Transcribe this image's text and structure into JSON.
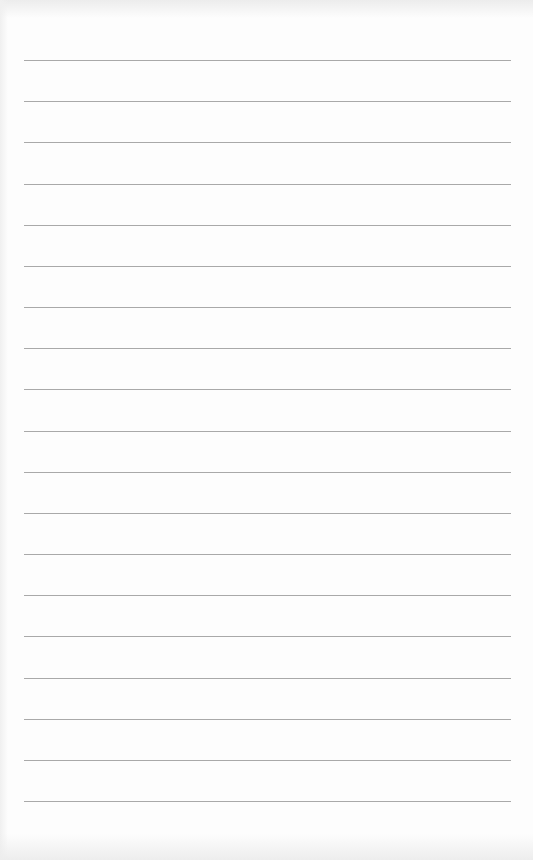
{
  "page": {
    "type": "lined-paper",
    "line_count": 19,
    "line_color": "#9a9a9a",
    "paper_color": "#fdfdfd",
    "text": []
  }
}
